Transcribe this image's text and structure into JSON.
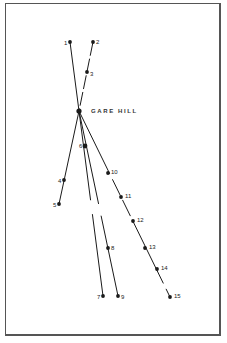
{
  "diagram": {
    "title": "GARE HILL",
    "center": {
      "x": 79,
      "y": 111
    },
    "points": [
      {
        "id": "1",
        "x": 70,
        "y": 42,
        "lx": -6,
        "ly": 2
      },
      {
        "id": "2",
        "x": 93,
        "y": 42,
        "lx": 3,
        "ly": 1
      },
      {
        "id": "3",
        "x": 87,
        "y": 72,
        "lx": 3,
        "ly": 3
      },
      {
        "id": "4",
        "x": 64,
        "y": 180,
        "lx": -6,
        "ly": 2
      },
      {
        "id": "5",
        "x": 59,
        "y": 204,
        "lx": -6,
        "ly": 2
      },
      {
        "id": "6",
        "x": 85,
        "y": 146,
        "lx": -6,
        "ly": 1
      },
      {
        "id": "7",
        "x": 103,
        "y": 296,
        "lx": -6,
        "ly": 2
      },
      {
        "id": "8",
        "x": 108,
        "y": 248,
        "lx": 3,
        "ly": 1
      },
      {
        "id": "9",
        "x": 118,
        "y": 296,
        "lx": 3,
        "ly": 2
      },
      {
        "id": "10",
        "x": 108,
        "y": 173,
        "lx": 3,
        "ly": 0
      },
      {
        "id": "11",
        "x": 121,
        "y": 197,
        "lx": 4,
        "ly": 0
      },
      {
        "id": "12",
        "x": 133,
        "y": 221,
        "lx": 4,
        "ly": 0
      },
      {
        "id": "13",
        "x": 145,
        "y": 248,
        "lx": 4,
        "ly": 0
      },
      {
        "id": "14",
        "x": 157,
        "y": 269,
        "lx": 4,
        "ly": 0
      },
      {
        "id": "15",
        "x": 170,
        "y": 297,
        "lx": 4,
        "ly": 0
      }
    ],
    "lines": [
      {
        "from": "1",
        "to": "center",
        "dash": ""
      },
      {
        "from": "2",
        "to": "center",
        "dash": "14 3"
      },
      {
        "from": "center",
        "to": "5",
        "dash": ""
      },
      {
        "from": "center",
        "to": "7",
        "dash": "90 14"
      },
      {
        "from": "center",
        "to": "9",
        "dash": "95 12"
      },
      {
        "from": "center",
        "to": "15",
        "dash": "70 6 18 5 18 5"
      }
    ],
    "colors": {
      "ink": "#1a1a1a",
      "frame": "#555555"
    }
  }
}
